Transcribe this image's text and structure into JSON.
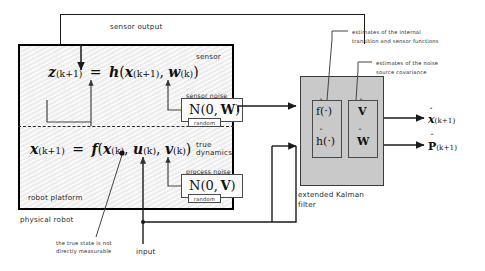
{
  "diagram": {
    "labels": {
      "sensor_output": "sensor output",
      "sensor": "sensor",
      "sensor_noise": "sensor noise",
      "true_dynamics_line1": "true",
      "true_dynamics_line2": "dynamics",
      "process_noise": "process noise",
      "random": "random",
      "robot_platform": "robot platform",
      "physical_robot": "physical robot",
      "true_state_note_line1": "the true state is not",
      "true_state_note_line2": "directly measurable",
      "input": "input",
      "ekf_line1": "extended Kalman",
      "ekf_line2": "filter",
      "note_internal_line1": "estimates of the internal",
      "note_internal_line2": "transition and sensor functions",
      "note_noise_line1": "estimates of the noise",
      "note_noise_line2": "source covariance"
    },
    "equations": {
      "sensor": {
        "lhs_var": "z",
        "lhs_sub": "(k+1)",
        "eq": "=",
        "fn": "h",
        "arg1_var": "x",
        "arg1_sub": "(k+1)",
        "arg2_var": "w",
        "arg2_sub": "(k)"
      },
      "dynamics": {
        "lhs_var": "x",
        "lhs_sub": "(k+1)",
        "eq": "=",
        "fn": "f",
        "arg1_var": "x",
        "arg1_sub": "(k)",
        "arg2_var": "u",
        "arg2_sub": "(k)",
        "arg3_var": "v",
        "arg3_sub": "(k)"
      }
    },
    "noise_blocks": {
      "sensor_noise_dist": "N(0, W)",
      "sensor_noise_mean": "0",
      "sensor_noise_cov": "W",
      "process_noise_dist": "N(0, V)",
      "process_noise_mean": "0",
      "process_noise_cov": "V"
    },
    "ekf_cells": {
      "f_hat": "f(·)",
      "h_hat": "h(·)",
      "v_hat": "V",
      "w_hat": "W"
    },
    "outputs": {
      "state_estimate_var": "x",
      "state_estimate_sub": "(k+1)",
      "covariance_var": "P",
      "covariance_sub": "(k+1)"
    },
    "colors": {
      "robot_fill": "#ededed",
      "ekf_fill": "#c9c9c9",
      "line": "#1a1a1a",
      "text": "#2b2b2b"
    }
  }
}
